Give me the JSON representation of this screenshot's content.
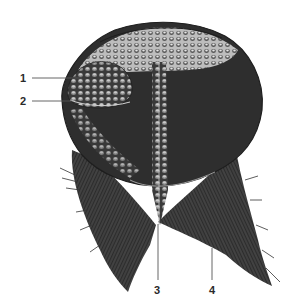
{
  "figure": {
    "colors": {
      "ink": "#1e1e1e",
      "dark_fill": "#2b2b2b",
      "mid_fill": "#4a4a4a",
      "highlight": "#d8d8d8",
      "leader_line": "#555555"
    }
  },
  "labels": [
    {
      "number": "1",
      "x": 20,
      "y": 73
    },
    {
      "number": "2",
      "x": 20,
      "y": 96
    },
    {
      "number": "3",
      "x": 153,
      "y": 285
    },
    {
      "number": "4",
      "x": 208,
      "y": 285
    }
  ]
}
